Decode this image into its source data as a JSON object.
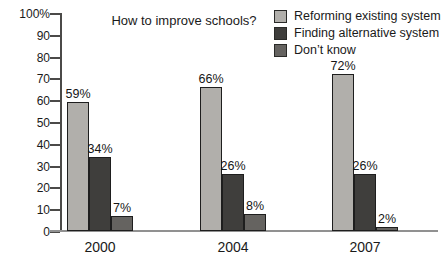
{
  "chart_data": {
    "type": "bar",
    "title": "How to improve schools?",
    "categories": [
      "2000",
      "2004",
      "2007"
    ],
    "series": [
      {
        "name": "Reforming existing system",
        "color": "#b1afab",
        "values": [
          59,
          66,
          72
        ],
        "labels": [
          "59%",
          "66%",
          "72%"
        ]
      },
      {
        "name": "Finding alternative system",
        "color": "#3f3e3c",
        "values": [
          34,
          26,
          26
        ],
        "labels": [
          "34%",
          "26%",
          "26%"
        ]
      },
      {
        "name": "Don’t know",
        "color": "#656360",
        "values": [
          7,
          8,
          2
        ],
        "labels": [
          "7%",
          "8%",
          "2%"
        ]
      }
    ],
    "ylim": [
      0,
      100
    ],
    "ytick_step": 10,
    "ytick_labels": [
      "100%",
      "90",
      "80",
      "70",
      "60",
      "50",
      "40",
      "30",
      "20",
      "10",
      "0"
    ],
    "grid": false,
    "legend_position": "top-right"
  },
  "colors": {
    "background": "#ffffff",
    "axis": "#4b4a48",
    "baseline": "#919191",
    "bar_border": "#1e1e1e",
    "text": "#1a1a1a"
  }
}
